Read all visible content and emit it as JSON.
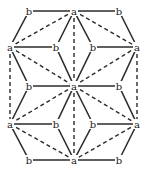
{
  "diagram": {
    "type": "graph",
    "stroke_color": "#2a2a2a",
    "background": "#ffffff",
    "nodes": [
      {
        "id": "n1",
        "label": "b",
        "x": 29,
        "y": 11
      },
      {
        "id": "n2",
        "label": "a",
        "x": 74,
        "y": 11
      },
      {
        "id": "n3",
        "label": "b",
        "x": 119,
        "y": 11
      },
      {
        "id": "n4",
        "label": "a",
        "x": 10,
        "y": 47
      },
      {
        "id": "n5",
        "label": "b",
        "x": 56,
        "y": 47
      },
      {
        "id": "n6",
        "label": "b",
        "x": 93,
        "y": 47
      },
      {
        "id": "n7",
        "label": "a",
        "x": 137,
        "y": 47
      },
      {
        "id": "n8",
        "label": "b",
        "x": 29,
        "y": 86
      },
      {
        "id": "n9",
        "label": "a",
        "x": 74,
        "y": 86
      },
      {
        "id": "n10",
        "label": "b",
        "x": 119,
        "y": 86
      },
      {
        "id": "n11",
        "label": "a",
        "x": 10,
        "y": 124
      },
      {
        "id": "n12",
        "label": "b",
        "x": 56,
        "y": 124
      },
      {
        "id": "n13",
        "label": "b",
        "x": 93,
        "y": 124
      },
      {
        "id": "n14",
        "label": "a",
        "x": 137,
        "y": 124
      },
      {
        "id": "n15",
        "label": "b",
        "x": 29,
        "y": 160
      },
      {
        "id": "n16",
        "label": "a",
        "x": 74,
        "y": 160
      },
      {
        "id": "n17",
        "label": "b",
        "x": 119,
        "y": 160
      }
    ],
    "edges": [
      {
        "from": "n1",
        "to": "n2",
        "style": "solid"
      },
      {
        "from": "n2",
        "to": "n3",
        "style": "solid"
      },
      {
        "from": "n1",
        "to": "n4",
        "style": "solid"
      },
      {
        "from": "n3",
        "to": "n7",
        "style": "solid"
      },
      {
        "from": "n2",
        "to": "n5",
        "style": "solid"
      },
      {
        "from": "n2",
        "to": "n6",
        "style": "solid"
      },
      {
        "from": "n2",
        "to": "n4",
        "style": "dashed"
      },
      {
        "from": "n2",
        "to": "n7",
        "style": "dashed"
      },
      {
        "from": "n2",
        "to": "n9",
        "style": "dashed"
      },
      {
        "from": "n4",
        "to": "n5",
        "style": "solid"
      },
      {
        "from": "n6",
        "to": "n7",
        "style": "solid"
      },
      {
        "from": "n4",
        "to": "n8",
        "style": "solid"
      },
      {
        "from": "n7",
        "to": "n10",
        "style": "solid"
      },
      {
        "from": "n5",
        "to": "n9",
        "style": "solid"
      },
      {
        "from": "n6",
        "to": "n9",
        "style": "solid"
      },
      {
        "from": "n4",
        "to": "n9",
        "style": "dashed"
      },
      {
        "from": "n7",
        "to": "n9",
        "style": "dashed"
      },
      {
        "from": "n4",
        "to": "n11",
        "style": "dashed"
      },
      {
        "from": "n7",
        "to": "n14",
        "style": "dashed"
      },
      {
        "from": "n8",
        "to": "n9",
        "style": "solid"
      },
      {
        "from": "n9",
        "to": "n10",
        "style": "solid"
      },
      {
        "from": "n8",
        "to": "n11",
        "style": "solid"
      },
      {
        "from": "n10",
        "to": "n14",
        "style": "solid"
      },
      {
        "from": "n9",
        "to": "n12",
        "style": "solid"
      },
      {
        "from": "n9",
        "to": "n13",
        "style": "solid"
      },
      {
        "from": "n9",
        "to": "n11",
        "style": "dashed"
      },
      {
        "from": "n9",
        "to": "n14",
        "style": "dashed"
      },
      {
        "from": "n9",
        "to": "n16",
        "style": "dashed"
      },
      {
        "from": "n11",
        "to": "n12",
        "style": "solid"
      },
      {
        "from": "n13",
        "to": "n14",
        "style": "solid"
      },
      {
        "from": "n11",
        "to": "n15",
        "style": "solid"
      },
      {
        "from": "n14",
        "to": "n17",
        "style": "solid"
      },
      {
        "from": "n12",
        "to": "n16",
        "style": "solid"
      },
      {
        "from": "n13",
        "to": "n16",
        "style": "solid"
      },
      {
        "from": "n11",
        "to": "n16",
        "style": "dashed"
      },
      {
        "from": "n14",
        "to": "n16",
        "style": "dashed"
      },
      {
        "from": "n15",
        "to": "n16",
        "style": "solid"
      },
      {
        "from": "n16",
        "to": "n17",
        "style": "solid"
      }
    ]
  }
}
